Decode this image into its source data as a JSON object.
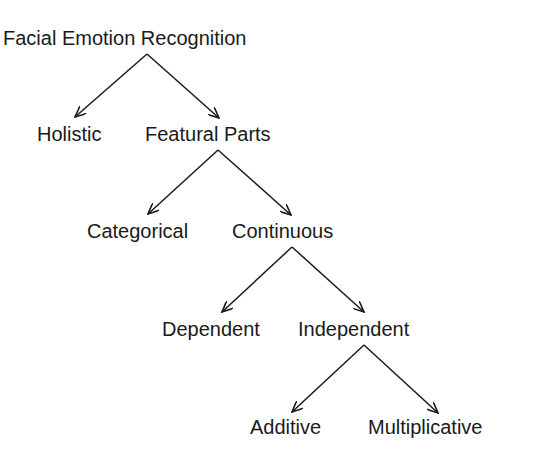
{
  "diagram": {
    "root": "Facial Emotion Recognition",
    "level1": [
      "Holistic",
      "Featural Parts"
    ],
    "level2": [
      "Categorical",
      "Continuous"
    ],
    "level3": [
      "Dependent",
      "Independent"
    ],
    "level4": [
      "Additive",
      "Multiplicative"
    ]
  },
  "edges": [
    {
      "from": "Facial Emotion Recognition",
      "to": "Holistic"
    },
    {
      "from": "Facial Emotion Recognition",
      "to": "Featural Parts"
    },
    {
      "from": "Featural Parts",
      "to": "Categorical"
    },
    {
      "from": "Featural Parts",
      "to": "Continuous"
    },
    {
      "from": "Continuous",
      "to": "Dependent"
    },
    {
      "from": "Continuous",
      "to": "Independent"
    },
    {
      "from": "Independent",
      "to": "Additive"
    },
    {
      "from": "Independent",
      "to": "Multiplicative"
    }
  ],
  "colors": {
    "line": "#1a1a1a",
    "text": "#1a1a1a",
    "background": "#ffffff"
  }
}
